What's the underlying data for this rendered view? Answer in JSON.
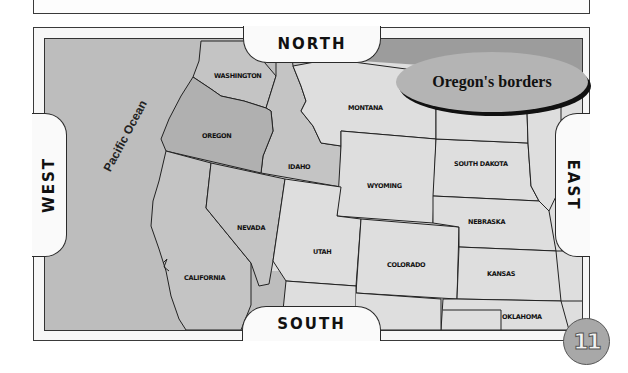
{
  "map": {
    "title": "Oregon's borders",
    "directions": {
      "north": "NORTH",
      "south": "SOUTH",
      "east": "EAST",
      "west": "WEST"
    },
    "ocean_label": "Pacific Ocean",
    "states": [
      {
        "name": "WASHINGTON",
        "x": 170,
        "y": 74
      },
      {
        "name": "OREGON",
        "x": 158,
        "y": 134
      },
      {
        "name": "IDAHO",
        "x": 288,
        "y": 165
      },
      {
        "name": "MONTANA",
        "x": 348,
        "y": 106
      },
      {
        "name": "WYOMING",
        "x": 367,
        "y": 184
      },
      {
        "name": "SOUTH DAKOTA",
        "x": 455,
        "y": 161
      },
      {
        "name": "NEBRASKA",
        "x": 468,
        "y": 220
      },
      {
        "name": "NEVADA",
        "x": 237,
        "y": 227
      },
      {
        "name": "UTAH",
        "x": 313,
        "y": 251
      },
      {
        "name": "COLORADO",
        "x": 387,
        "y": 263
      },
      {
        "name": "KANSAS",
        "x": 487,
        "y": 272
      },
      {
        "name": "OKLAHOMA",
        "x": 502,
        "y": 316
      },
      {
        "name": "CALIFORNIA",
        "x": 184,
        "y": 277
      }
    ],
    "colors": {
      "ocean": "#bdbdbd",
      "oregon": "#b0b0b0",
      "neighbors": "#c4c4c4",
      "other_states": "#dedede",
      "highlight_strip": "#9c9c9c",
      "oval": "#b4b4b4"
    }
  },
  "page": {
    "number": "11"
  }
}
